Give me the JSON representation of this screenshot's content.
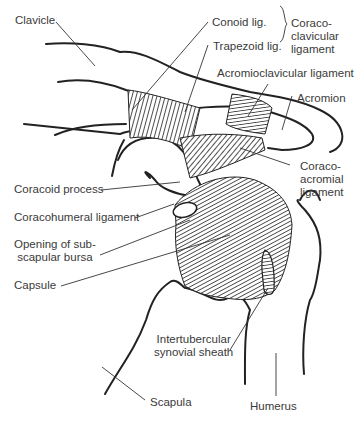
{
  "diagram": {
    "line_color": "#222222",
    "text_color": "#3a3a3a",
    "labels": {
      "clavicle": "Clavicle",
      "conoid": "Conoid lig.",
      "trapezoid": "Trapezoid lig.",
      "coracoclavicular": "Coraco-\nclavicular\nligament",
      "acromioclavicular": "Acromioclavicular ligament",
      "acromion": "Acromion",
      "coracoacromial": "Coraco-\nacromial\nligament",
      "coracoid_process": "Coracoid process",
      "coracohumeral": "Coracohumeral ligament",
      "subscapular_bursa": "Opening of sub-\nscapular bursa",
      "capsule": "Capsule",
      "intertubercular": "Intertubercular\nsynovial sheath",
      "scapula": "Scapula",
      "humerus": "Humerus"
    }
  }
}
